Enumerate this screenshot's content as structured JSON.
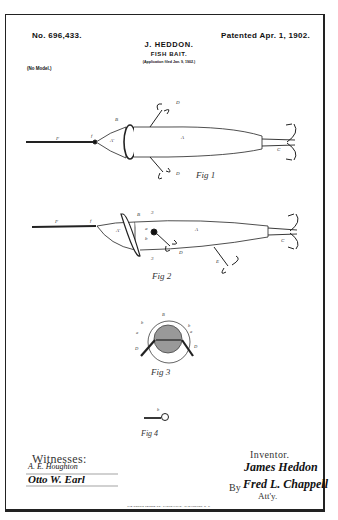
{
  "header": {
    "patent_number": "No. 696,433.",
    "patent_date": "Patented Apr. 1, 1902.",
    "inventor_name": "J. HEDDON.",
    "title": "FISH BAIT.",
    "application": "(Application filed Jan. 9, 1902.)",
    "model_note": "(No Model.)"
  },
  "figures": [
    {
      "id": "fig1",
      "caption": "Fig 1",
      "labels": [
        "F",
        "f",
        "B",
        "A'",
        "A",
        "D",
        "D",
        "C"
      ]
    },
    {
      "id": "fig2",
      "caption": "Fig 2",
      "labels": [
        "F",
        "f",
        "B",
        "A'",
        "A",
        "a",
        "b",
        "D",
        "E",
        "C",
        "3",
        "3"
      ]
    },
    {
      "id": "fig3",
      "caption": "Fig 3",
      "labels": [
        "B",
        "b",
        "a",
        "a",
        "b",
        "D",
        "D"
      ]
    },
    {
      "id": "fig4",
      "caption": "Fig 4",
      "labels": [
        "b"
      ]
    }
  ],
  "footer": {
    "witnesses_label": "Witnesses:",
    "witness_1": "A. E. Houghton",
    "witness_2": "Otto W. Earl",
    "inventor_label": "Inventor.",
    "inventor_signature": "James Heddon",
    "by_label": "By",
    "attorney_signature": "Fred L. Chappell",
    "attorney_label": "Att'y.",
    "printer_imprint": "THE NORRIS PETERS CO., PHOTO-LITHO., WASHINGTON, D. C."
  }
}
